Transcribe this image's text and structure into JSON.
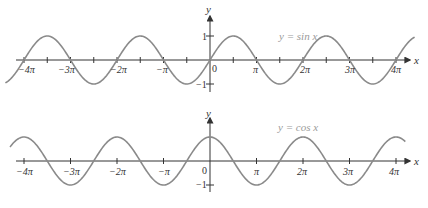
{
  "chart_data": [
    {
      "type": "line",
      "title": "y = sin x",
      "function": "sin",
      "xlabel": "x",
      "ylabel": "y",
      "x_ticks": [
        "-4π",
        "-3π",
        "-2π",
        "-π",
        "0",
        "π",
        "2π",
        "3π",
        "4π"
      ],
      "x_tick_values_in_pi": [
        -4,
        -3,
        -2,
        -1,
        0,
        1,
        2,
        3,
        4
      ],
      "minor_ticks_in_pi": [
        -3.5,
        -2.5,
        -1.5,
        -0.5,
        0.5,
        1.5,
        2.5,
        3.5
      ],
      "y_ticks": [
        "1",
        "-1"
      ],
      "y_tick_values": [
        1,
        -1
      ],
      "xlim_in_pi": [
        -4.4,
        4.4
      ],
      "ylim": [
        -1,
        1
      ],
      "grid": false,
      "curve_color": "#8a8a8a",
      "axis_color": "#333333",
      "points": [
        {
          "x_pi": -4,
          "y": 0
        },
        {
          "x_pi": -3.5,
          "y": 1
        },
        {
          "x_pi": -3,
          "y": 0
        },
        {
          "x_pi": -2.5,
          "y": -1
        },
        {
          "x_pi": -2,
          "y": 0
        },
        {
          "x_pi": -1.5,
          "y": 1
        },
        {
          "x_pi": -1,
          "y": 0
        },
        {
          "x_pi": -0.5,
          "y": -1
        },
        {
          "x_pi": 0,
          "y": 0
        },
        {
          "x_pi": 0.5,
          "y": 1
        },
        {
          "x_pi": 1,
          "y": 0
        },
        {
          "x_pi": 1.5,
          "y": -1
        },
        {
          "x_pi": 2,
          "y": 0
        },
        {
          "x_pi": 2.5,
          "y": 1
        },
        {
          "x_pi": 3,
          "y": 0
        },
        {
          "x_pi": 3.5,
          "y": -1
        },
        {
          "x_pi": 4,
          "y": 0
        }
      ]
    },
    {
      "type": "line",
      "title": "y = cos x",
      "function": "cos",
      "xlabel": "x",
      "ylabel": "y",
      "x_ticks": [
        "-4π",
        "-3π",
        "-2π",
        "-π",
        "0",
        "π",
        "2π",
        "3π",
        "4π"
      ],
      "x_tick_values_in_pi": [
        -4,
        -3,
        -2,
        -1,
        0,
        1,
        2,
        3,
        4
      ],
      "minor_ticks_in_pi": [],
      "y_ticks": [
        "-1"
      ],
      "y_tick_values": [
        -1
      ],
      "xlim_in_pi": [
        -4.3,
        4.2
      ],
      "ylim": [
        -1,
        1
      ],
      "grid": false,
      "curve_color": "#8a8a8a",
      "axis_color": "#333333",
      "points": [
        {
          "x_pi": -4,
          "y": 1
        },
        {
          "x_pi": -3.5,
          "y": 0
        },
        {
          "x_pi": -3,
          "y": -1
        },
        {
          "x_pi": -2.5,
          "y": 0
        },
        {
          "x_pi": -2,
          "y": 1
        },
        {
          "x_pi": -1.5,
          "y": 0
        },
        {
          "x_pi": -1,
          "y": -1
        },
        {
          "x_pi": -0.5,
          "y": 0
        },
        {
          "x_pi": 0,
          "y": 1
        },
        {
          "x_pi": 0.5,
          "y": 0
        },
        {
          "x_pi": 1,
          "y": -1
        },
        {
          "x_pi": 1.5,
          "y": 0
        },
        {
          "x_pi": 2,
          "y": 1
        },
        {
          "x_pi": 2.5,
          "y": 0
        },
        {
          "x_pi": 3,
          "y": -1
        },
        {
          "x_pi": 3.5,
          "y": 0
        },
        {
          "x_pi": 4,
          "y": 1
        }
      ]
    }
  ],
  "plots": {
    "sin": {
      "title": "y = sin x",
      "x_axis_name": "x",
      "y_axis_name": "y",
      "origin_label": "0",
      "y_top_label": "1",
      "y_bottom_label": "−1",
      "tick_labels": [
        "−4π",
        "−3π",
        "−2π",
        "−π",
        "π",
        "2π",
        "3π",
        "4π"
      ]
    },
    "cos": {
      "title": "y = cos x",
      "x_axis_name": "x",
      "y_axis_name": "y",
      "origin_label": "0",
      "y_bottom_label": "−1",
      "tick_labels": [
        "−4π",
        "−3π",
        "−2π",
        "−π",
        "π",
        "2π",
        "3π",
        "4π"
      ]
    }
  }
}
